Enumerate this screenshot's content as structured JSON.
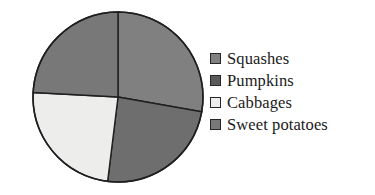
{
  "chart_data": {
    "type": "pie",
    "title": "",
    "subtitle": "",
    "xlabel": "",
    "ylabel": "",
    "grid": false,
    "legend_position": "right",
    "categories": [
      "Squashes",
      "Pumpkins",
      "Cabbages",
      "Sweet potatoes"
    ],
    "values": [
      28,
      24,
      24,
      24
    ],
    "units": "percent",
    "start_angle_deg": 0,
    "direction": "clockwise",
    "slices": [
      {
        "label": "Squashes",
        "value": 28,
        "start_angle_deg": 0,
        "end_angle_deg": 100,
        "color": "#808080",
        "swatch_color": "#808080",
        "position": "upper-right"
      },
      {
        "label": "Pumpkins",
        "value": 24,
        "start_angle_deg": 100,
        "end_angle_deg": 187,
        "color": "#6e6e6e",
        "swatch_color": "#5a5a5a",
        "position": "lower-right"
      },
      {
        "label": "Cabbages",
        "value": 24,
        "start_angle_deg": 187,
        "end_angle_deg": 273,
        "color": "#ededeb",
        "swatch_color": "#ededeb",
        "position": "lower-left"
      },
      {
        "label": "Sweet potatoes",
        "value": 24,
        "start_angle_deg": 273,
        "end_angle_deg": 360,
        "color": "#787878",
        "swatch_color": "#787878",
        "position": "upper-left"
      }
    ],
    "geometry": {
      "center_x": 118,
      "center_y": 97,
      "radius": 85,
      "outline_color": "#1f1f1f"
    }
  },
  "legend": {
    "items": [
      {
        "label": "Squashes",
        "color": "#808080"
      },
      {
        "label": "Pumpkins",
        "color": "#5a5a5a"
      },
      {
        "label": "Cabbages",
        "color": "#ededeb"
      },
      {
        "label": "Sweet potatoes",
        "color": "#787878"
      }
    ]
  }
}
